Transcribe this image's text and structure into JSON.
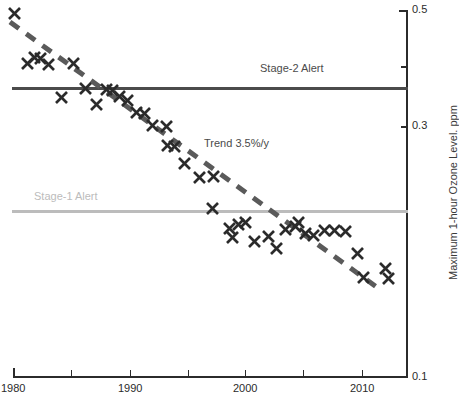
{
  "chart_data": {
    "type": "scatter",
    "title": "",
    "xlabel": "",
    "ylabel": "Maximum 1-hour Ozone Level. ppm",
    "xlim": [
      1980,
      2013
    ],
    "ylim": [
      0.1,
      0.5
    ],
    "grid": false,
    "legend_position": "none",
    "x_ticks": [
      {
        "value": 1980,
        "label": "1980",
        "px": 13
      },
      {
        "value": 1985,
        "label": "",
        "px": 71
      },
      {
        "value": 1990,
        "label": "1990",
        "px": 130
      },
      {
        "value": 1995,
        "label": "",
        "px": 188
      },
      {
        "value": 2000,
        "label": "2000",
        "px": 245
      },
      {
        "value": 2005,
        "label": "",
        "px": 303
      },
      {
        "value": 2010,
        "label": "2010",
        "px": 362
      }
    ],
    "y_ticks": [
      {
        "value": 0.5,
        "label": "0.5",
        "px": 10
      },
      {
        "value": 0.4,
        "label": "",
        "px": 66
      },
      {
        "value": 0.3,
        "label": "0.3",
        "px": 126
      },
      {
        "value": 0.2,
        "label": "",
        "px": 218
      },
      {
        "value": 0.1,
        "label": "0.1",
        "px": 377
      }
    ],
    "series": [
      {
        "name": "Maximum 1-hour ozone",
        "marker": "x",
        "color": "#2b2b2b",
        "points": [
          {
            "x": 1980,
            "y": 0.49,
            "px": 14,
            "py": 13
          },
          {
            "x": 1981,
            "y": 0.42,
            "px": 27,
            "py": 63
          },
          {
            "x": 1982,
            "y": 0.43,
            "px": 34,
            "py": 57
          },
          {
            "x": 1983,
            "y": 0.42,
            "px": 40,
            "py": 58
          },
          {
            "x": 1984,
            "y": 0.42,
            "px": 48,
            "py": 64
          },
          {
            "x": 1985,
            "y": 0.42,
            "px": 73,
            "py": 63
          },
          {
            "x": 1986,
            "y": 0.37,
            "px": 61,
            "py": 97
          },
          {
            "x": 1987,
            "y": 0.39,
            "px": 85,
            "py": 88
          },
          {
            "x": 1988,
            "y": 0.36,
            "px": 96,
            "py": 104
          },
          {
            "x": 1989,
            "y": 0.385,
            "px": 106,
            "py": 89
          },
          {
            "x": 1990,
            "y": 0.385,
            "px": 112,
            "py": 90
          },
          {
            "x": 1991,
            "y": 0.37,
            "px": 119,
            "py": 96
          },
          {
            "x": 1992,
            "y": 0.365,
            "px": 127,
            "py": 100
          },
          {
            "x": 1993,
            "y": 0.355,
            "px": 136,
            "py": 112
          },
          {
            "x": 1994,
            "y": 0.345,
            "px": 144,
            "py": 113
          },
          {
            "x": 1995,
            "y": 0.33,
            "px": 152,
            "py": 125
          },
          {
            "x": 1996,
            "y": 0.325,
            "px": 166,
            "py": 126
          },
          {
            "x": 1997,
            "y": 0.305,
            "px": 167,
            "py": 145
          },
          {
            "x": 1998,
            "y": 0.3,
            "px": 174,
            "py": 146
          },
          {
            "x": 1999,
            "y": 0.285,
            "px": 184,
            "py": 163
          },
          {
            "x": 2000,
            "y": 0.275,
            "px": 199,
            "py": 177
          },
          {
            "x": 2001,
            "y": 0.27,
            "px": 213,
            "py": 176
          },
          {
            "x": 2002,
            "y": 0.235,
            "px": 212,
            "py": 208
          },
          {
            "x": 2003,
            "y": 0.215,
            "px": 229,
            "py": 228
          },
          {
            "x": 2004,
            "y": 0.22,
            "px": 238,
            "py": 224
          },
          {
            "x": 2005,
            "y": 0.225,
            "px": 245,
            "py": 222
          },
          {
            "x": 2006,
            "y": 0.205,
            "px": 232,
            "py": 237
          },
          {
            "x": 2007,
            "y": 0.195,
            "px": 254,
            "py": 241
          },
          {
            "x": 2008,
            "y": 0.2,
            "px": 268,
            "py": 236
          },
          {
            "x": 2009,
            "y": 0.19,
            "px": 276,
            "py": 248
          },
          {
            "x": 2010,
            "y": 0.21,
            "px": 285,
            "py": 229
          },
          {
            "x": 2011,
            "y": 0.215,
            "px": 295,
            "py": 226
          },
          {
            "x": 2012,
            "y": 0.225,
            "px": 298,
            "py": 222
          },
          {
            "x": 2013,
            "y": 0.205,
            "px": 305,
            "py": 233
          },
          {
            "x": 2014,
            "y": 0.2,
            "px": 313,
            "py": 235
          },
          {
            "x": 2015,
            "y": 0.215,
            "px": 324,
            "py": 230
          },
          {
            "x": 2016,
            "y": 0.215,
            "px": 334,
            "py": 230
          },
          {
            "x": 2017,
            "y": 0.215,
            "px": 345,
            "py": 231
          },
          {
            "x": 2018,
            "y": 0.185,
            "px": 357,
            "py": 253
          },
          {
            "x": 2019,
            "y": 0.165,
            "px": 363,
            "py": 277
          },
          {
            "x": 2020,
            "y": 0.17,
            "px": 385,
            "py": 268
          },
          {
            "x": 2021,
            "y": 0.175,
            "px": 388,
            "py": 278
          }
        ]
      }
    ],
    "reference_lines": [
      {
        "name": "Stage-2 Alert",
        "label": "Stage-2 Alert",
        "value": 0.35,
        "color": "#4b4b4b",
        "style": "solid",
        "py": 88,
        "x_start_px": 12,
        "x_end_px": 407,
        "label_px": 260,
        "label_py": 62
      },
      {
        "name": "Stage-1 Alert",
        "label": "Stage-1 Alert",
        "value": 0.2,
        "color": "#bcbcbc",
        "style": "solid",
        "py": 211,
        "x_start_px": 12,
        "x_end_px": 407,
        "label_px": 34,
        "label_py": 190
      }
    ],
    "trend": {
      "label": "Trend 3.5%/y",
      "rate_percent_per_year": 3.5,
      "color": "#5a5a5a",
      "style": "dashed",
      "x1_px": 10,
      "y1_px": 22,
      "x2_px": 378,
      "y2_px": 288,
      "label_px": 204,
      "label_py": 137
    },
    "annotations": [
      {
        "name": "stage-2-alert-label",
        "text": "Stage-2 Alert"
      },
      {
        "name": "stage-1-alert-label",
        "text": "Stage-1 Alert"
      },
      {
        "name": "trend-label",
        "text": "Trend 3.5%/y"
      }
    ],
    "axes_geometry": {
      "x_axis_py": 377,
      "x_axis_start_px": 13,
      "x_axis_end_px": 407,
      "y_axis_px": 407,
      "y_axis_top_py": 10,
      "y_axis_bottom_py": 377
    }
  }
}
